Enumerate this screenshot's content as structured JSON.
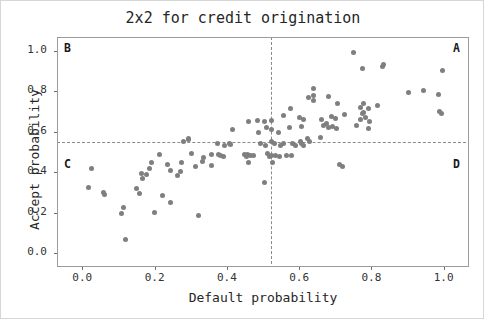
{
  "chart_data": {
    "type": "scatter",
    "title": "2x2 for credit origination",
    "xlabel": "Default probability",
    "ylabel": "Accept probability",
    "xlim": [
      -0.07,
      1.07
    ],
    "ylim": [
      -0.07,
      1.07
    ],
    "xticks": [
      0.0,
      0.2,
      0.4,
      0.6,
      0.8,
      1.0
    ],
    "yticks": [
      0.0,
      0.2,
      0.4,
      0.6,
      0.8,
      1.0
    ],
    "xtick_labels": [
      "0.0",
      "0.2",
      "0.4",
      "0.6",
      "0.8",
      "1.0"
    ],
    "ytick_labels": [
      "0.0",
      "0.2",
      "0.4",
      "0.6",
      "0.8",
      "1.0"
    ],
    "grid": false,
    "legend": null,
    "marker_color": "#7f7f7f",
    "marker_size": 5,
    "reference_lines": [
      {
        "orientation": "vertical",
        "value": 0.52,
        "style": "dashed",
        "color": "#8a8a8a"
      },
      {
        "orientation": "horizontal",
        "value": 0.555,
        "style": "dashed",
        "color": "#8a8a8a"
      }
    ],
    "quadrant_labels": [
      {
        "label": "B",
        "x": 0.0,
        "y": 1.02,
        "corner": "top-left"
      },
      {
        "label": "A",
        "x": 1.0,
        "y": 1.02,
        "corner": "top-right"
      },
      {
        "label": "C",
        "x": 0.0,
        "y": 0.46,
        "corner": "mid-left"
      },
      {
        "label": "D",
        "x": 1.0,
        "y": 0.46,
        "corner": "mid-right"
      }
    ],
    "points": [
      [
        0.748,
        1.0
      ],
      [
        0.636,
        0.82
      ],
      [
        0.772,
        0.92
      ],
      [
        0.828,
        0.93
      ],
      [
        0.831,
        0.94
      ],
      [
        0.995,
        0.91
      ],
      [
        0.622,
        0.775
      ],
      [
        0.679,
        0.78
      ],
      [
        0.636,
        0.76
      ],
      [
        0.637,
        0.785
      ],
      [
        0.704,
        0.745
      ],
      [
        0.899,
        0.8
      ],
      [
        0.941,
        0.81
      ],
      [
        0.983,
        0.79
      ],
      [
        0.573,
        0.72
      ],
      [
        0.768,
        0.725
      ],
      [
        0.776,
        0.745
      ],
      [
        0.788,
        0.72
      ],
      [
        0.814,
        0.735
      ],
      [
        0.774,
        0.7
      ],
      [
        0.985,
        0.705
      ],
      [
        0.991,
        0.695
      ],
      [
        0.458,
        0.655
      ],
      [
        0.482,
        0.66
      ],
      [
        0.502,
        0.655
      ],
      [
        0.52,
        0.66
      ],
      [
        0.553,
        0.685
      ],
      [
        0.599,
        0.675
      ],
      [
        0.61,
        0.665
      ],
      [
        0.66,
        0.665
      ],
      [
        0.686,
        0.68
      ],
      [
        0.698,
        0.67
      ],
      [
        0.722,
        0.69
      ],
      [
        0.772,
        0.695
      ],
      [
        0.768,
        0.665
      ],
      [
        0.78,
        0.675
      ],
      [
        0.793,
        0.655
      ],
      [
        0.412,
        0.615
      ],
      [
        0.484,
        0.6
      ],
      [
        0.506,
        0.625
      ],
      [
        0.52,
        0.615
      ],
      [
        0.54,
        0.6
      ],
      [
        0.57,
        0.625
      ],
      [
        0.604,
        0.63
      ],
      [
        0.666,
        0.635
      ],
      [
        0.673,
        0.645
      ],
      [
        0.679,
        0.625
      ],
      [
        0.69,
        0.63
      ],
      [
        0.7,
        0.62
      ],
      [
        0.755,
        0.635
      ],
      [
        0.788,
        0.62
      ],
      [
        0.276,
        0.555
      ],
      [
        0.292,
        0.565
      ],
      [
        0.292,
        0.57
      ],
      [
        0.372,
        0.545
      ],
      [
        0.392,
        0.535
      ],
      [
        0.404,
        0.545
      ],
      [
        0.408,
        0.54
      ],
      [
        0.49,
        0.545
      ],
      [
        0.505,
        0.535
      ],
      [
        0.52,
        0.555
      ],
      [
        0.53,
        0.545
      ],
      [
        0.547,
        0.535
      ],
      [
        0.555,
        0.545
      ],
      [
        0.578,
        0.545
      ],
      [
        0.588,
        0.535
      ],
      [
        0.6,
        0.555
      ],
      [
        0.605,
        0.545
      ],
      [
        0.61,
        0.535
      ],
      [
        0.62,
        0.57
      ],
      [
        0.627,
        0.555
      ],
      [
        0.655,
        0.575
      ],
      [
        0.212,
        0.495
      ],
      [
        0.3,
        0.5
      ],
      [
        0.332,
        0.48
      ],
      [
        0.354,
        0.495
      ],
      [
        0.374,
        0.495
      ],
      [
        0.38,
        0.49
      ],
      [
        0.388,
        0.485
      ],
      [
        0.445,
        0.495
      ],
      [
        0.452,
        0.485
      ],
      [
        0.455,
        0.495
      ],
      [
        0.462,
        0.49
      ],
      [
        0.47,
        0.49
      ],
      [
        0.51,
        0.5
      ],
      [
        0.514,
        0.485
      ],
      [
        0.52,
        0.488
      ],
      [
        0.533,
        0.49
      ],
      [
        0.543,
        0.485
      ],
      [
        0.562,
        0.49
      ],
      [
        0.575,
        0.49
      ],
      [
        0.188,
        0.455
      ],
      [
        0.232,
        0.445
      ],
      [
        0.272,
        0.455
      ],
      [
        0.31,
        0.435
      ],
      [
        0.33,
        0.46
      ],
      [
        0.355,
        0.44
      ],
      [
        0.456,
        0.455
      ],
      [
        0.523,
        0.455
      ],
      [
        0.71,
        0.445
      ],
      [
        0.716,
        0.435
      ],
      [
        0.022,
        0.425
      ],
      [
        0.16,
        0.4
      ],
      [
        0.175,
        0.395
      ],
      [
        0.182,
        0.425
      ],
      [
        0.24,
        0.415
      ],
      [
        0.268,
        0.41
      ],
      [
        0.164,
        0.375
      ],
      [
        0.262,
        0.39
      ],
      [
        0.5,
        0.355
      ],
      [
        0.013,
        0.33
      ],
      [
        0.055,
        0.305
      ],
      [
        0.06,
        0.295
      ],
      [
        0.148,
        0.325
      ],
      [
        0.155,
        0.3
      ],
      [
        0.218,
        0.29
      ],
      [
        0.24,
        0.255
      ],
      [
        0.112,
        0.23
      ],
      [
        0.105,
        0.2
      ],
      [
        0.198,
        0.205
      ],
      [
        0.318,
        0.19
      ],
      [
        0.118,
        0.07
      ]
    ]
  }
}
